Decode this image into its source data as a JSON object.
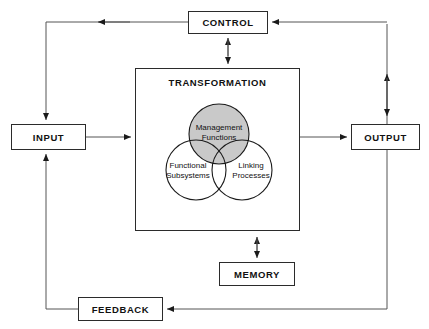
{
  "diagram": {
    "nodes": {
      "control": "CONTROL",
      "input": "INPUT",
      "output": "OUTPUT",
      "memory": "MEMORY",
      "feedback": "FEEDBACK",
      "transformation": "TRANSFORMATION"
    },
    "venn": {
      "top_line1": "Management",
      "top_line2": "Functions",
      "left_line1": "Functional",
      "left_line2": "Subsystems",
      "right_line1": "Linking",
      "right_line2": "Processes"
    },
    "colors": {
      "stroke": "#2b2b2b",
      "text": "#111111",
      "background": "#ffffff",
      "shaded_circle_fill": "#c9c9c9"
    }
  }
}
